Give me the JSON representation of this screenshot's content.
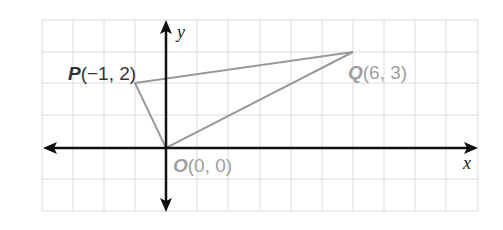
{
  "diagram": {
    "type": "coordinate-plane",
    "grid": {
      "x_min": -4,
      "x_max": 10,
      "y_min": -2,
      "y_max": 4,
      "unit_px": 31,
      "origin_px": [
        166,
        148
      ],
      "color": "#d9d9d9"
    },
    "axes": {
      "x_label": "x",
      "y_label": "y",
      "color": "#111111"
    },
    "triangle": {
      "stroke": "#9a9a9a",
      "vertices": [
        [
          -1,
          2
        ],
        [
          6,
          3
        ],
        [
          0,
          0
        ]
      ]
    },
    "points": {
      "P": {
        "name": "P",
        "coords": "(−1, 2)",
        "x": -1,
        "y": 2,
        "color": "#333333"
      },
      "Q": {
        "name": "Q",
        "coords": "(6, 3)",
        "x": 6,
        "y": 3,
        "color": "#a0a0a0"
      },
      "O": {
        "name": "O",
        "coords": "(0, 0)",
        "x": 0,
        "y": 0,
        "color": "#a0a0a0"
      }
    }
  }
}
